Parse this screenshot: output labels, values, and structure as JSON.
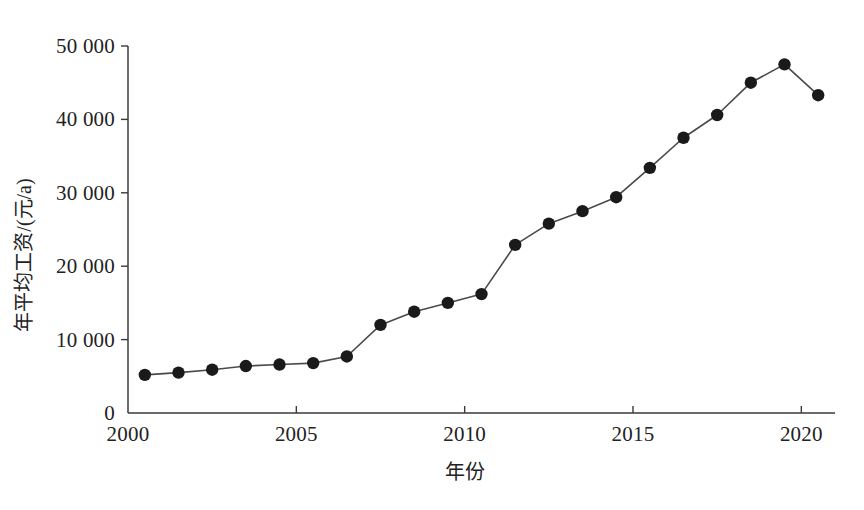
{
  "chart_data": {
    "type": "line",
    "title": "",
    "subtitle": "",
    "xlabel": "年份",
    "ylabel": "年平均工资/(元/a)",
    "xlim": [
      2000,
      2021
    ],
    "ylim": [
      0,
      50000
    ],
    "grid": false,
    "legend": null,
    "x": [
      2000.5,
      2001.5,
      2002.5,
      2003.5,
      2004.5,
      2005.5,
      2006.5,
      2007.5,
      2008.5,
      2009.5,
      2010.5,
      2011.5,
      2012.5,
      2013.5,
      2014.5,
      2015.5,
      2016.5,
      2017.5,
      2018.5,
      2019.5,
      2020.5
    ],
    "values": [
      5200,
      5500,
      5900,
      6400,
      6600,
      6800,
      7700,
      12000,
      13800,
      15000,
      16200,
      22900,
      25800,
      27500,
      29400,
      33400,
      37500,
      40600,
      45000,
      47500,
      43300
    ],
    "series": [
      {
        "name": "年平均工资",
        "values": [
          5200,
          5500,
          5900,
          6400,
          6600,
          6800,
          7700,
          12000,
          13800,
          15000,
          16200,
          22900,
          25800,
          27500,
          29400,
          33400,
          37500,
          40600,
          45000,
          47500,
          43300
        ],
        "marker": "filled-circle",
        "color": "#1a1a1a",
        "line_color": "#4a4a4a"
      }
    ],
    "xticks": [
      2000,
      2005,
      2010,
      2015,
      2020
    ],
    "xtick_labels": [
      "2000",
      "2005",
      "2010",
      "2015",
      "2020"
    ],
    "yticks": [
      0,
      10000,
      20000,
      30000,
      40000,
      50000
    ],
    "ytick_labels": [
      "0",
      "10 000",
      "20 000",
      "30 000",
      "40 000",
      "50 000"
    ],
    "axis_color": "#3a3a3a",
    "background_color": "#ffffff"
  }
}
